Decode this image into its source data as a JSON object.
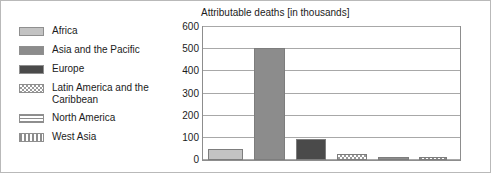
{
  "chart_data": {
    "type": "bar",
    "title": "Attributable deaths [in thousands]",
    "xlabel": "",
    "ylabel": "",
    "ylim": [
      0,
      600
    ],
    "yticks": [
      600,
      500,
      400,
      300,
      200,
      100,
      0
    ],
    "grid": true,
    "legend_position": "left",
    "categories": [
      "Africa",
      "Asia and the Pacific",
      "Europe",
      "Latin America and the\nCaribbean",
      "North America",
      "West Asia"
    ],
    "values": [
      48,
      505,
      93,
      25,
      12,
      15
    ],
    "bars": [
      {
        "label": "Africa",
        "value": 48,
        "pattern": "light-gray-solid",
        "fill_class": "fill-africa",
        "left_pct": 2.0,
        "width_pct": 13.5
      },
      {
        "label": "Asia and the Pacific",
        "value": 505,
        "pattern": "medium-gray-solid",
        "fill_class": "fill-asia",
        "left_pct": 20.0,
        "width_pct": 12.0
      },
      {
        "label": "Europe",
        "value": 93,
        "pattern": "dark-gray-solid",
        "fill_class": "fill-europe",
        "left_pct": 36.0,
        "width_pct": 12.0
      },
      {
        "label": "Latin America and the Caribbean",
        "value": 25,
        "pattern": "checkered",
        "fill_class": "fill-latin",
        "left_pct": 52.0,
        "width_pct": 12.0
      },
      {
        "label": "North America",
        "value": 12,
        "pattern": "horizontal-stripes",
        "fill_class": "fill-northamerica",
        "left_pct": 68.0,
        "width_pct": 12.0
      },
      {
        "label": "West Asia",
        "value": 15,
        "pattern": "vertical-stripes",
        "fill_class": "fill-westasia",
        "left_pct": 84.0,
        "width_pct": 11.0
      }
    ]
  },
  "legend": {
    "items": [
      {
        "label": "Africa",
        "swatch_class": "fill-africa",
        "pattern": "light-gray-solid"
      },
      {
        "label": "Asia and the Pacific",
        "swatch_class": "fill-asia",
        "pattern": "medium-gray-solid"
      },
      {
        "label": "Europe",
        "swatch_class": "fill-europe",
        "pattern": "dark-gray-solid"
      },
      {
        "label": "Latin America and the\nCaribbean",
        "swatch_class": "fill-latin",
        "pattern": "checkered"
      },
      {
        "label": "North America",
        "swatch_class": "fill-northamerica",
        "pattern": "horizontal-stripes"
      },
      {
        "label": "West Asia",
        "swatch_class": "fill-westasia",
        "pattern": "vertical-stripes"
      }
    ]
  },
  "colors": {
    "background": "#ffffff",
    "text": "#1b1b1b",
    "frame": "#8d8d8d",
    "gridline": "#a8a8a8",
    "africa": "#c3c3c3",
    "asia": "#8c8c8c",
    "europe": "#4a4a4a",
    "pattern_gray": "#9a9a9a"
  }
}
